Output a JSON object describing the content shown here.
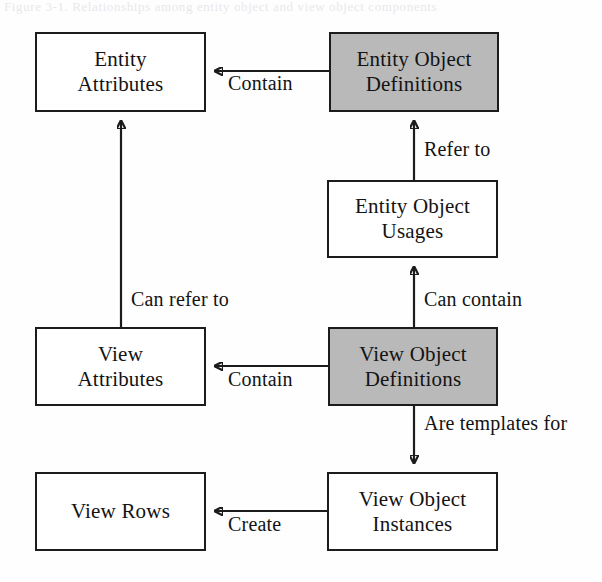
{
  "diagram": {
    "caption_remnant": "Figure 3-1. Relationships among entity object and view object components",
    "nodes": [
      {
        "id": "entity-attributes",
        "lines": [
          "Entity",
          "Attributes"
        ],
        "shaded": false,
        "x": 35,
        "y": 32,
        "w": 171,
        "h": 80
      },
      {
        "id": "entity-object-definitions",
        "lines": [
          "Entity Object",
          "Definitions"
        ],
        "shaded": true,
        "x": 329,
        "y": 32,
        "w": 170,
        "h": 80
      },
      {
        "id": "entity-object-usages",
        "lines": [
          "Entity Object",
          "Usages"
        ],
        "shaded": false,
        "x": 327,
        "y": 180,
        "w": 171,
        "h": 78
      },
      {
        "id": "view-attributes",
        "lines": [
          "View",
          "Attributes"
        ],
        "shaded": false,
        "x": 35,
        "y": 327,
        "w": 171,
        "h": 79
      },
      {
        "id": "view-object-definitions",
        "lines": [
          "View Object",
          "Definitions"
        ],
        "shaded": true,
        "x": 328,
        "y": 327,
        "w": 170,
        "h": 79
      },
      {
        "id": "view-rows",
        "lines": [
          "View Rows"
        ],
        "shaded": false,
        "x": 35,
        "y": 472,
        "w": 171,
        "h": 79
      },
      {
        "id": "view-object-instances",
        "lines": [
          "View Object",
          "Instances"
        ],
        "shaded": false,
        "x": 327,
        "y": 472,
        "w": 171,
        "h": 79
      }
    ],
    "edges": [
      {
        "id": "contain-entity",
        "label": "Contain",
        "from": "entity-object-definitions",
        "to": "entity-attributes",
        "label_x": 228,
        "label_y": 72
      },
      {
        "id": "refer-to",
        "label": "Refer to",
        "from": "entity-object-usages",
        "to": "entity-object-definitions",
        "label_x": 424,
        "label_y": 138
      },
      {
        "id": "can-contain",
        "label": "Can contain",
        "from": "view-object-definitions",
        "to": "entity-object-usages",
        "label_x": 424,
        "label_y": 288
      },
      {
        "id": "can-refer-to",
        "label": "Can refer to",
        "from": "view-attributes",
        "to": "entity-attributes",
        "label_x": 131,
        "label_y": 288
      },
      {
        "id": "contain-view",
        "label": "Contain",
        "from": "view-object-definitions",
        "to": "view-attributes",
        "label_x": 228,
        "label_y": 368
      },
      {
        "id": "are-templates-for",
        "label": "Are templates for",
        "from": "view-object-definitions",
        "to": "view-object-instances",
        "label_x": 424,
        "label_y": 412
      },
      {
        "id": "create",
        "label": "Create",
        "from": "view-object-instances",
        "to": "view-rows",
        "label_x": 228,
        "label_y": 513
      }
    ],
    "colors": {
      "stroke": "#1c1c1c",
      "shaded_fill": "#b9b9b9",
      "plain_fill": "#ffffff",
      "background": "#fefefe"
    }
  }
}
